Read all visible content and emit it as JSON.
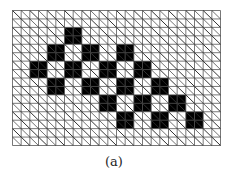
{
  "figure": {
    "caption": "(a)",
    "grid": {
      "cols": 24,
      "rows": 16,
      "width_px": 208,
      "height_px": 135,
      "line_color": "#555555",
      "diagonal_color": "#333333",
      "fill_color": "#000000",
      "diagonals": "top-left to bottom-right in every cell"
    },
    "filled_blocks_2x2": [
      {
        "col": 6,
        "row": 2
      },
      {
        "col": 4,
        "row": 4
      },
      {
        "col": 8,
        "row": 4
      },
      {
        "col": 12,
        "row": 4
      },
      {
        "col": 2,
        "row": 6
      },
      {
        "col": 6,
        "row": 6
      },
      {
        "col": 10,
        "row": 6
      },
      {
        "col": 14,
        "row": 6
      },
      {
        "col": 4,
        "row": 8
      },
      {
        "col": 8,
        "row": 8
      },
      {
        "col": 12,
        "row": 8
      },
      {
        "col": 16,
        "row": 8
      },
      {
        "col": 10,
        "row": 10
      },
      {
        "col": 14,
        "row": 10
      },
      {
        "col": 18,
        "row": 10
      },
      {
        "col": 12,
        "row": 12
      },
      {
        "col": 16,
        "row": 12
      },
      {
        "col": 20,
        "row": 12
      }
    ]
  }
}
